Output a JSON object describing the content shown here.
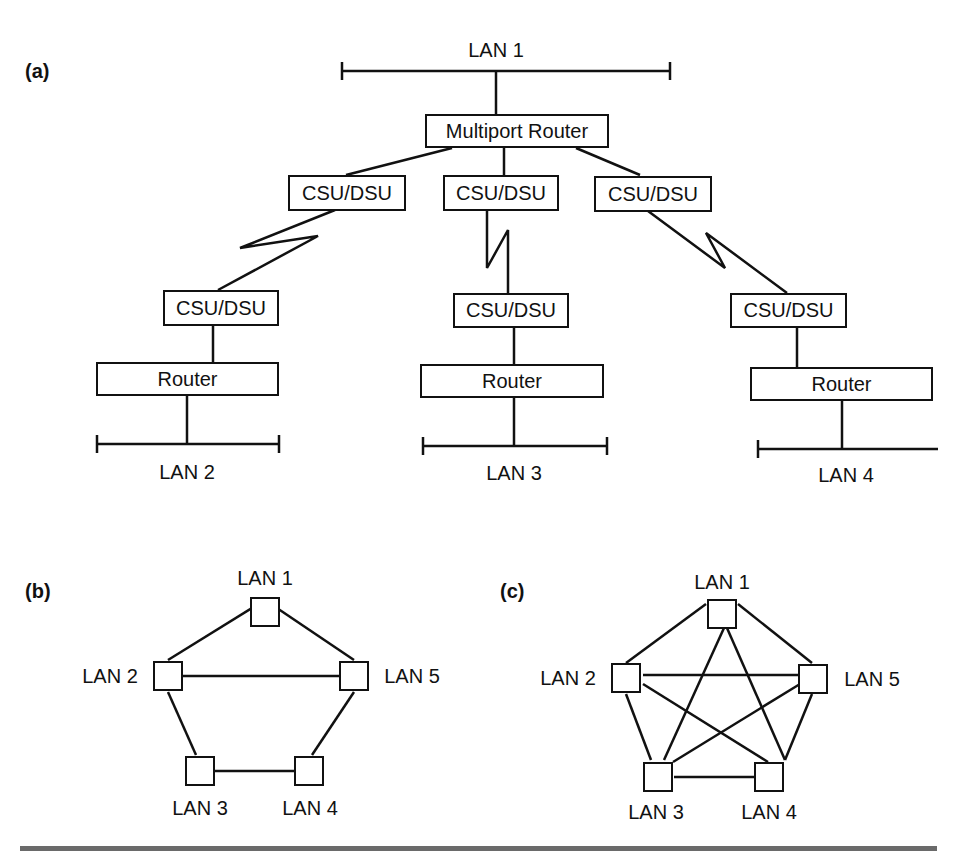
{
  "panels": {
    "a": {
      "label": "(a)",
      "lan1": {
        "label": "LAN 1"
      },
      "multiport_router": {
        "label": "Multiport Router"
      },
      "branches": [
        {
          "remote_csu_label": "CSU/DSU",
          "local_csu_label": "CSU/DSU",
          "router_label": "Router",
          "lan_label": "LAN 2"
        },
        {
          "remote_csu_label": "CSU/DSU",
          "local_csu_label": "CSU/DSU",
          "router_label": "Router",
          "lan_label": "LAN 3"
        },
        {
          "remote_csu_label": "CSU/DSU",
          "local_csu_label": "CSU/DSU",
          "router_label": "Router",
          "lan_label": "LAN 4"
        }
      ]
    },
    "b": {
      "label": "(b)",
      "nodes": [
        {
          "id": "LAN1",
          "label": "LAN 1"
        },
        {
          "id": "LAN2",
          "label": "LAN 2"
        },
        {
          "id": "LAN3",
          "label": "LAN 3"
        },
        {
          "id": "LAN4",
          "label": "LAN 4"
        },
        {
          "id": "LAN5",
          "label": "LAN 5"
        }
      ],
      "edges": [
        [
          "LAN1",
          "LAN2"
        ],
        [
          "LAN1",
          "LAN5"
        ],
        [
          "LAN2",
          "LAN5"
        ],
        [
          "LAN2",
          "LAN3"
        ],
        [
          "LAN5",
          "LAN4"
        ],
        [
          "LAN3",
          "LAN4"
        ]
      ]
    },
    "c": {
      "label": "(c)",
      "nodes": [
        {
          "id": "LAN1",
          "label": "LAN 1"
        },
        {
          "id": "LAN2",
          "label": "LAN 2"
        },
        {
          "id": "LAN3",
          "label": "LAN 3"
        },
        {
          "id": "LAN4",
          "label": "LAN 4"
        },
        {
          "id": "LAN5",
          "label": "LAN 5"
        }
      ],
      "edges": [
        [
          "LAN1",
          "LAN2"
        ],
        [
          "LAN1",
          "LAN5"
        ],
        [
          "LAN1",
          "LAN3"
        ],
        [
          "LAN1",
          "LAN4"
        ],
        [
          "LAN2",
          "LAN5"
        ],
        [
          "LAN2",
          "LAN3"
        ],
        [
          "LAN2",
          "LAN4"
        ],
        [
          "LAN5",
          "LAN3"
        ],
        [
          "LAN5",
          "LAN4"
        ],
        [
          "LAN3",
          "LAN4"
        ]
      ]
    }
  }
}
